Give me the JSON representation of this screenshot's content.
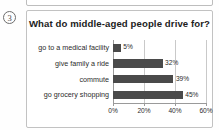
{
  "item_number": "3",
  "chart_data": {
    "type": "bar",
    "orientation": "horizontal",
    "title": "What do middle-aged people drive for?",
    "xlabel": "",
    "ylabel": "",
    "categories": [
      "go to a medical facility",
      "give family a ride",
      "commute",
      "go grocery shopping"
    ],
    "values": [
      5,
      32,
      39,
      45
    ],
    "value_labels": [
      "5%",
      "32%",
      "39%",
      "45%"
    ],
    "xlim": [
      0,
      60
    ],
    "xticks": [
      0,
      20,
      40,
      60
    ],
    "xtick_labels": [
      "0%",
      "20%",
      "40%",
      "60%"
    ],
    "grid": true,
    "legend": null,
    "bar_color": "#4a4a4a",
    "grid_color": "#c9c9c9",
    "axis_color": "#9a9a9a"
  }
}
